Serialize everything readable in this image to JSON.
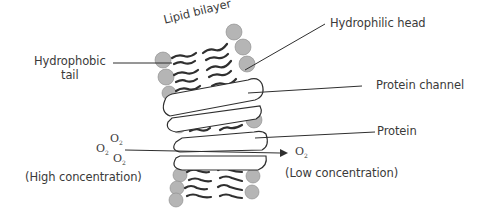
{
  "diagram": {
    "title_label": "Lipid bilayer",
    "labels": {
      "hydrophobic_tail": [
        "Hydrophobic",
        "tail"
      ],
      "hydrophilic_head": "Hydrophilic head",
      "protein_channel": "Protein channel",
      "protein": "Protein",
      "high_concentration": "(High concentration)",
      "low_concentration": "(Low concentration)"
    },
    "molecules": {
      "o2_left": [
        "O",
        "O",
        "O"
      ],
      "o2_subscript": "2",
      "o2_right": "O"
    },
    "colors": {
      "head_fill": "#b5b5b5",
      "line": "#2f2f2f",
      "text": "#3a3a3a"
    }
  }
}
